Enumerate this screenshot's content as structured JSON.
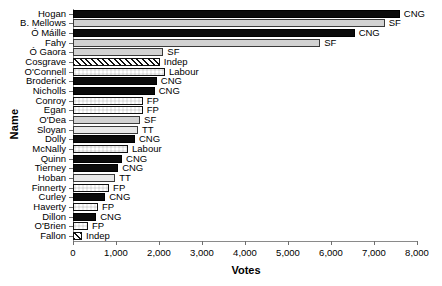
{
  "chart_data": {
    "type": "bar",
    "orientation": "horizontal",
    "title": "",
    "xlabel": "Votes",
    "ylabel": "Name",
    "xlim": [
      0,
      8000
    ],
    "xticks": [
      0,
      1000,
      2000,
      3000,
      4000,
      5000,
      6000,
      7000,
      8000
    ],
    "xticklabels": [
      "0",
      "1,000",
      "2,000",
      "3,000",
      "4,000",
      "5,000",
      "6,000",
      "7,000",
      "8,000"
    ],
    "grid": false,
    "legend": "inline-annotation",
    "categories": [
      "Hogan",
      "B. Mellows",
      "Ó Máille",
      "Fahy",
      "Ó Gaora",
      "Cosgrave",
      "O'Connell",
      "Broderick",
      "Nicholls",
      "Conroy",
      "Egan",
      "O'Dea",
      "Sloyan",
      "Dolly",
      "McNally",
      "Quinn",
      "Tierney",
      "Hoban",
      "Finnerty",
      "Curley",
      "Haverty",
      "Dillon",
      "O'Brien",
      "Fallon"
    ],
    "values": [
      7600,
      7250,
      6550,
      5750,
      2100,
      2020,
      2140,
      1950,
      1900,
      1620,
      1620,
      1560,
      1510,
      1440,
      1280,
      1140,
      1050,
      980,
      840,
      750,
      580,
      540,
      350,
      210
    ],
    "parties": [
      "CNG",
      "SF",
      "CNG",
      "SF",
      "SF",
      "Indep",
      "Labour",
      "CNG",
      "CNG",
      "FP",
      "FP",
      "SF",
      "TT",
      "CNG",
      "Labour",
      "CNG",
      "CNG",
      "TT",
      "FP",
      "CNG",
      "FP",
      "CNG",
      "FP",
      "Indep"
    ],
    "bars": [
      {
        "name": "Hogan",
        "value": 7600,
        "party": "CNG"
      },
      {
        "name": "B. Mellows",
        "value": 7250,
        "party": "SF"
      },
      {
        "name": "Ó Máille",
        "value": 6550,
        "party": "CNG"
      },
      {
        "name": "Fahy",
        "value": 5750,
        "party": "SF"
      },
      {
        "name": "Ó Gaora",
        "value": 2100,
        "party": "SF"
      },
      {
        "name": "Cosgrave",
        "value": 2020,
        "party": "Indep"
      },
      {
        "name": "O'Connell",
        "value": 2140,
        "party": "Labour"
      },
      {
        "name": "Broderick",
        "value": 1950,
        "party": "CNG"
      },
      {
        "name": "Nicholls",
        "value": 1900,
        "party": "CNG"
      },
      {
        "name": "Conroy",
        "value": 1620,
        "party": "FP"
      },
      {
        "name": "Egan",
        "value": 1620,
        "party": "FP"
      },
      {
        "name": "O'Dea",
        "value": 1560,
        "party": "SF"
      },
      {
        "name": "Sloyan",
        "value": 1510,
        "party": "TT"
      },
      {
        "name": "Dolly",
        "value": 1440,
        "party": "CNG"
      },
      {
        "name": "McNally",
        "value": 1280,
        "party": "Labour"
      },
      {
        "name": "Quinn",
        "value": 1140,
        "party": "CNG"
      },
      {
        "name": "Tierney",
        "value": 1050,
        "party": "CNG"
      },
      {
        "name": "Hoban",
        "value": 980,
        "party": "TT"
      },
      {
        "name": "Finnerty",
        "value": 840,
        "party": "FP"
      },
      {
        "name": "Curley",
        "value": 750,
        "party": "CNG"
      },
      {
        "name": "Haverty",
        "value": 580,
        "party": "FP"
      },
      {
        "name": "Dillon",
        "value": 540,
        "party": "CNG"
      },
      {
        "name": "O'Brien",
        "value": 350,
        "party": "FP"
      },
      {
        "name": "Fallon",
        "value": 210,
        "party": "Indep"
      }
    ],
    "party_colors": {
      "CNG": "#0b0b0b",
      "SF": "#d2d2d2",
      "TT": "#e8e8e8",
      "FP": "#111111",
      "Labour": "#111111",
      "Indep": "#111111"
    }
  }
}
